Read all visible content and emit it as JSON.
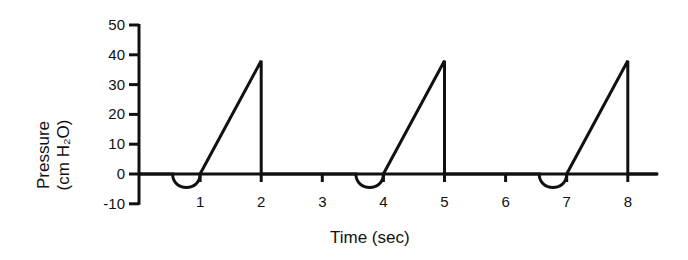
{
  "chart_data": {
    "type": "line",
    "title": "",
    "xlabel": "Time (sec)",
    "ylabel": "Pressure (cm H2O)",
    "ylabel_lines": [
      "Pressure",
      "(cm H₂O)"
    ],
    "xlim": [
      0,
      8.5
    ],
    "ylim": [
      -10,
      50
    ],
    "x_ticks": [
      1,
      2,
      3,
      4,
      5,
      6,
      7,
      8
    ],
    "y_ticks": [
      -10,
      0,
      10,
      20,
      30,
      40,
      50
    ],
    "grid": false,
    "legend": null,
    "series": [
      {
        "name": "Airway pressure",
        "description": "Patient-triggered breaths: small negative deflection (~-3) followed by linear rise to ~38 then abrupt drop to 0",
        "points": [
          [
            0,
            0
          ],
          [
            0.55,
            0
          ],
          [
            0.8,
            -3
          ],
          [
            1.0,
            0
          ],
          [
            2.0,
            38
          ],
          [
            2.0,
            0
          ],
          [
            3.55,
            0
          ],
          [
            3.8,
            -3
          ],
          [
            4.0,
            0
          ],
          [
            5.0,
            38
          ],
          [
            5.0,
            0
          ],
          [
            6.55,
            0
          ],
          [
            6.8,
            -3
          ],
          [
            7.0,
            0
          ],
          [
            8.0,
            38
          ],
          [
            8.0,
            0
          ],
          [
            8.5,
            0
          ]
        ]
      }
    ]
  },
  "axis": {
    "x_label": "Time (sec)",
    "y_label_line1": "Pressure",
    "y_label_line2": "(cm H₂O)"
  }
}
